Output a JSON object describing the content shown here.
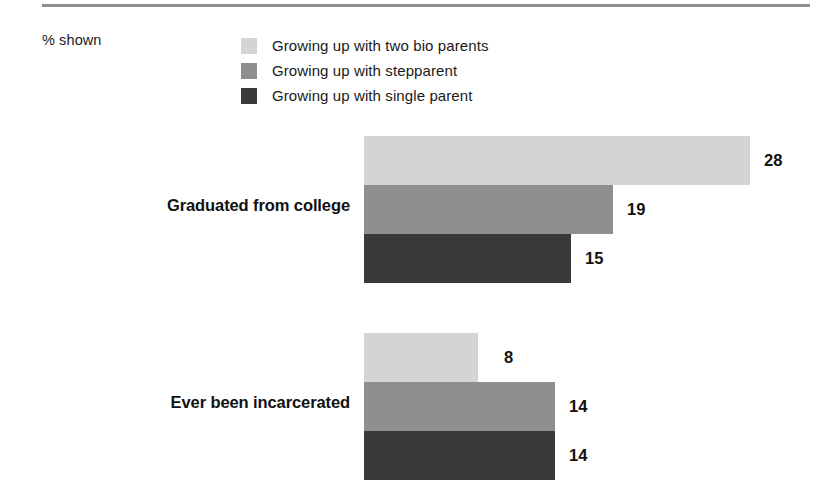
{
  "header": {
    "note": "% shown"
  },
  "legend": {
    "position": "top",
    "items": [
      {
        "label": "Growing up with two bio parents",
        "color": "#d4d4d4",
        "swatch_name": "legend-swatch-two-bio-parents"
      },
      {
        "label": "Growing up with stepparent",
        "color": "#8f8f8f",
        "swatch_name": "legend-swatch-stepparent"
      },
      {
        "label": "Growing up with single parent",
        "color": "#3a3a3a",
        "swatch_name": "legend-swatch-single-parent"
      }
    ]
  },
  "chart_data": {
    "type": "bar",
    "orientation": "horizontal",
    "title": "",
    "subtitle": "",
    "xlabel": "",
    "ylabel": "",
    "note": "% shown",
    "grid": false,
    "legend_position": "top",
    "xlim": [
      0,
      28
    ],
    "categories": [
      "Graduated from college",
      "Ever been incarcerated"
    ],
    "series": [
      {
        "name": "Growing up with two bio parents",
        "color": "#d4d4d4",
        "values": [
          28,
          8
        ]
      },
      {
        "name": "Growing up with stepparent",
        "color": "#8f8f8f",
        "values": [
          19,
          14
        ]
      },
      {
        "name": "Growing up with single parent",
        "color": "#3a3a3a",
        "values": [
          15,
          14
        ]
      }
    ],
    "value_labels": [
      [
        "28",
        "19",
        "15"
      ],
      [
        "8",
        "14",
        "14"
      ]
    ]
  },
  "groups": [
    {
      "label": "Graduated from college",
      "label_top": 196,
      "top": 136,
      "bars": [
        {
          "value": "28",
          "width": 386,
          "color": "#d4d4d4",
          "name": "bar-graduated-two-bio-parents"
        },
        {
          "value": "19",
          "width": 249,
          "color": "#8f8f8f",
          "name": "bar-graduated-stepparent"
        },
        {
          "value": "15",
          "width": 207,
          "color": "#3a3a3a",
          "name": "bar-graduated-single-parent"
        }
      ]
    },
    {
      "label": "Ever been incarcerated",
      "label_top": 393,
      "top": 333,
      "bars": [
        {
          "value": "8",
          "width": 114,
          "color": "#d4d4d4",
          "name": "bar-incarcerated-two-bio-parents"
        },
        {
          "value": "14",
          "width": 191,
          "color": "#8f8f8f",
          "name": "bar-incarcerated-stepparent"
        },
        {
          "value": "14",
          "width": 191,
          "color": "#3a3a3a",
          "name": "bar-incarcerated-single-parent"
        }
      ]
    }
  ],
  "style": {
    "rule_color": "#8e8e8e",
    "text_color": "#1a1a1a"
  }
}
